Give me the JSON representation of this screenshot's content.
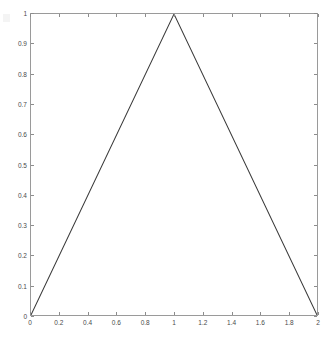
{
  "chart_data": {
    "type": "line",
    "title": "",
    "xlabel": "",
    "ylabel": "",
    "xlim": [
      0,
      2
    ],
    "ylim": [
      0,
      1
    ],
    "grid": false,
    "legend": null,
    "box": true,
    "tick_direction": "in",
    "line_color": "#3a3a3a",
    "line_width": 1,
    "axis_color": "#9a9a9a",
    "background_color": "#ffffff",
    "xticks": [
      0,
      0.2,
      0.4,
      0.6,
      0.8,
      1,
      1.2,
      1.4,
      1.6,
      1.8,
      2
    ],
    "xticklabels": [
      "0",
      "0.2",
      "0.4",
      "0.6",
      "0.8",
      "1",
      "1.2",
      "1.4",
      "1.6",
      "1.8",
      "2"
    ],
    "yticks": [
      0,
      0.1,
      0.2,
      0.3,
      0.4,
      0.5,
      0.6,
      0.7,
      0.8,
      0.9,
      1
    ],
    "yticklabels": [
      "0",
      "0.1",
      "0.2",
      "0.3",
      "0.4",
      "0.5",
      "0.6",
      "0.7",
      "0.8",
      "0.9",
      "1"
    ],
    "series": [
      {
        "name": "triangular waveform",
        "x": [
          0,
          1,
          2
        ],
        "y": [
          0,
          1,
          0
        ]
      }
    ]
  }
}
